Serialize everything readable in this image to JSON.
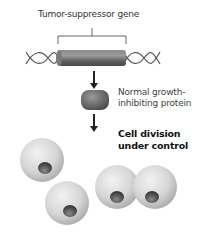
{
  "diagram": {
    "gene_label": "Tumor-suppressor gene",
    "protein_label_line1": "Normal growth-",
    "protein_label_line2": "inhibiting protein",
    "result_label_line1": "Cell division",
    "result_label_line2": "under control",
    "colors": {
      "gene_cylinder": "#6e6e6e",
      "protein": "#707070",
      "cell": "#d4d4d4",
      "nucleus": "#555555",
      "arrow": "#222222",
      "dna_strand": "#555555"
    },
    "cells": [
      {
        "name": "single-cell-top-left"
      },
      {
        "name": "single-cell-bottom"
      },
      {
        "name": "dividing-cell"
      }
    ]
  }
}
